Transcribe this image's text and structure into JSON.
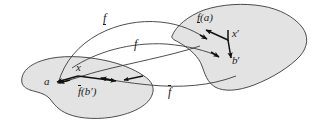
{
  "figure": {
    "background_color": "#ffffff",
    "blob_fill_color": "#e3e3e3",
    "blob_stroke_color": "#3a3a3a",
    "arrow_color": "#111111",
    "flow_color": "#3a3a3a"
  },
  "labels": {
    "f_lower": {
      "base": "f",
      "decoration": "underbar",
      "text": "f"
    },
    "f_plain": {
      "base": "f",
      "decoration": "none",
      "text": "f"
    },
    "f_upper": {
      "base": "f",
      "decoration": "overbar",
      "text": "f"
    },
    "f_of_a": {
      "prefix": "f",
      "decoration": "underbar",
      "suffix": "(a)",
      "text": "f(a)"
    },
    "x_prime": {
      "text": "x",
      "prime": "′"
    },
    "b_prime": {
      "text": "b",
      "prime": "′"
    },
    "a": {
      "text": "a"
    },
    "x": {
      "text": "x"
    },
    "f_of_b_prime": {
      "prefix": "f",
      "decoration": "overbar",
      "suffix": "(b′)",
      "text": "f(b′)"
    }
  },
  "elements": {
    "left_set": "left-blob",
    "right_set": "right-blob",
    "mappings": [
      {
        "name": "f-lower-curve",
        "from": "left-set",
        "to": "right-set",
        "label": "f-underbar"
      },
      {
        "name": "f-plain-curve",
        "from": "left-set",
        "to": "right-set",
        "label": "f"
      },
      {
        "name": "f-upper-curve",
        "from": "right-set",
        "to": "left-set",
        "label": "f-overbar"
      }
    ]
  }
}
